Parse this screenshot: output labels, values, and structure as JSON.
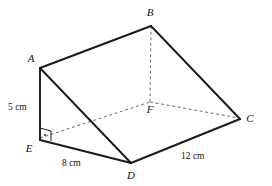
{
  "figure": {
    "type": "geometry-diagram",
    "shape": "triangular-prism",
    "background_color": "#ffffff",
    "stroke_color": "#1a1a1a",
    "hidden_stroke_color": "#6d6d6d",
    "width": 272,
    "height": 186,
    "vertices": [
      {
        "id": "A",
        "label": "A",
        "x": 40,
        "y": 68,
        "label_x": 31,
        "label_y": 62,
        "hidden": false
      },
      {
        "id": "B",
        "label": "B",
        "x": 151,
        "y": 26,
        "label_x": 150,
        "label_y": 16,
        "hidden": false
      },
      {
        "id": "C",
        "label": "C",
        "x": 240,
        "y": 119,
        "label_x": 250,
        "label_y": 122,
        "hidden": false
      },
      {
        "id": "D",
        "label": "D",
        "x": 131,
        "y": 163,
        "label_x": 131,
        "label_y": 179,
        "hidden": false
      },
      {
        "id": "E",
        "label": "E",
        "x": 40,
        "y": 140,
        "label_x": 29,
        "label_y": 152,
        "hidden": false
      },
      {
        "id": "F",
        "label": "F",
        "x": 150,
        "y": 102,
        "label_x": 150,
        "label_y": 113,
        "hidden": true
      }
    ],
    "solid_edges": [
      {
        "from": "A",
        "to": "B"
      },
      {
        "from": "B",
        "to": "C"
      },
      {
        "from": "A",
        "to": "E"
      },
      {
        "from": "A",
        "to": "D"
      },
      {
        "from": "E",
        "to": "D"
      },
      {
        "from": "D",
        "to": "C"
      }
    ],
    "hidden_edges": [
      {
        "from": "B",
        "to": "F"
      },
      {
        "from": "E",
        "to": "F"
      },
      {
        "from": "F",
        "to": "C"
      }
    ],
    "right_angle": {
      "at": "E",
      "x": 40,
      "y": 128,
      "size": 11,
      "dot_x": 45,
      "dot_y": 134
    },
    "measurements": [
      {
        "id": "height",
        "text": "5 cm",
        "x": 8,
        "y": 110,
        "edge": "A-E"
      },
      {
        "id": "depth",
        "text": "8 cm",
        "x": 62,
        "y": 166,
        "edge": "E-D"
      },
      {
        "id": "width",
        "text": "12 cm",
        "x": 181,
        "y": 159,
        "edge": "D-C"
      }
    ]
  }
}
